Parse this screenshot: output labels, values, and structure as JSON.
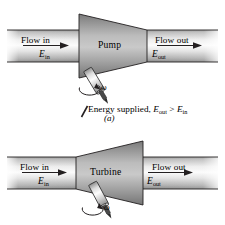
{
  "figure": {
    "kind": "engineering-diagram",
    "panels": [
      {
        "id": "a",
        "panel_label": "(a)",
        "device_label": "Pump",
        "inlet": {
          "flow_label": "Flow in",
          "energy_label": "E",
          "energy_subscript": "in"
        },
        "outlet": {
          "flow_label": "Flow out",
          "energy_label": "E",
          "energy_subscript": "out"
        },
        "shaft": {
          "omega_label": "ω",
          "rotation": "clockwise"
        },
        "caption_prefix": "Energy supplied, ",
        "caption_lhs": "E",
        "caption_lhs_sub": "out",
        "caption_relation": " > ",
        "caption_rhs": "E",
        "caption_rhs_sub": "in",
        "body_shape": "trapezoid-wide-left"
      },
      {
        "id": "b",
        "panel_label": "(b)",
        "device_label": "Turbine",
        "inlet": {
          "flow_label": "Flow in",
          "energy_label": "E",
          "energy_subscript": "in"
        },
        "outlet": {
          "flow_label": "Flow out",
          "energy_label": "E",
          "energy_subscript": "out"
        },
        "shaft": {
          "omega_label": "ω",
          "rotation": "counterclockwise"
        },
        "body_shape": "trapezoid-wide-right"
      }
    ]
  },
  "colors": {
    "outline": "#231f20",
    "pipe_light": "#f2f2f2",
    "pipe_mid": "#cfcfcf",
    "pipe_dark": "#8d8d8d",
    "body_light": "#cbcbcb",
    "body_mid": "#9d9d9d",
    "body_dark": "#6e6e6e",
    "shaft_light": "#fafafa",
    "shaft_mid": "#c8c8c8",
    "shaft_dark": "#7a7a7a",
    "background": "#ffffff"
  }
}
